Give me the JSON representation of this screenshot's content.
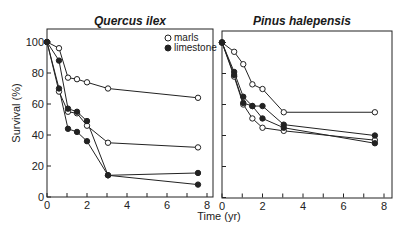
{
  "chart_data": [
    {
      "type": "line",
      "title": "Quercus ilex",
      "xlabel": "Time (yr)",
      "ylabel": "Survival (%)",
      "xlim": [
        0,
        8
      ],
      "ylim": [
        0,
        100
      ],
      "xticks": [
        0,
        2,
        4,
        6,
        8
      ],
      "yticks": [
        0,
        20,
        40,
        60,
        80,
        100
      ],
      "grid": false,
      "legend": {
        "position": "upper right",
        "entries": [
          {
            "label": "marls",
            "marker": "open-circle"
          },
          {
            "label": "limestone",
            "marker": "filled-circle"
          }
        ]
      },
      "series": [
        {
          "name": "marls",
          "marker": "open",
          "x": [
            0,
            0.6,
            1.05,
            1.5,
            2,
            3.05,
            7.55
          ],
          "y": [
            100,
            96,
            77,
            76,
            74,
            70,
            64
          ]
        },
        {
          "name": "marls",
          "marker": "open",
          "x": [
            0,
            0.6,
            1.05,
            1.5,
            2,
            3.05,
            7.55
          ],
          "y": [
            100,
            68,
            55,
            54,
            46,
            35,
            32
          ]
        },
        {
          "name": "limestone",
          "marker": "filled",
          "x": [
            0,
            0.6,
            1.05,
            1.5,
            2,
            3.05,
            7.55
          ],
          "y": [
            100,
            88,
            57,
            55,
            49,
            14,
            15.5
          ]
        },
        {
          "name": "limestone",
          "marker": "filled",
          "x": [
            0,
            0.6,
            1.05,
            1.5,
            2,
            3.05,
            7.55
          ],
          "y": [
            100,
            70,
            44,
            42,
            36,
            14,
            8
          ]
        }
      ]
    },
    {
      "type": "line",
      "title": "Pinus halepensis",
      "xlabel": "Time (yr)",
      "ylabel": "",
      "xlim": [
        0,
        8
      ],
      "ylim": [
        0,
        100
      ],
      "xticks": [
        0,
        2,
        4,
        6,
        8
      ],
      "yticks": [
        0,
        20,
        40,
        60,
        80,
        100
      ],
      "grid": false,
      "series": [
        {
          "name": "marls",
          "marker": "open",
          "x": [
            0,
            0.6,
            1.05,
            1.5,
            2,
            3.05,
            7.55
          ],
          "y": [
            100,
            94,
            86,
            73,
            70,
            55,
            55
          ]
        },
        {
          "name": "marls",
          "marker": "open",
          "x": [
            0,
            0.6,
            1.05,
            1.5,
            2,
            3.05,
            7.55
          ],
          "y": [
            100,
            78,
            60,
            51,
            45,
            43,
            37
          ]
        },
        {
          "name": "limestone",
          "marker": "filled",
          "x": [
            0,
            0.6,
            1.05,
            1.5,
            2,
            3.05,
            7.55
          ],
          "y": [
            100,
            81,
            65,
            59,
            59,
            47,
            40
          ]
        },
        {
          "name": "limestone",
          "marker": "filled",
          "x": [
            0,
            0.6,
            1.05,
            1.5,
            2,
            3.05,
            7.55
          ],
          "y": [
            100,
            79,
            61,
            59,
            51,
            45,
            35
          ]
        }
      ]
    }
  ],
  "figure": {
    "shared_xlabel": "Time (yr)",
    "ylabel": "Survival (%)",
    "legend": {
      "marls": "marls",
      "limestone": "limestone"
    }
  }
}
